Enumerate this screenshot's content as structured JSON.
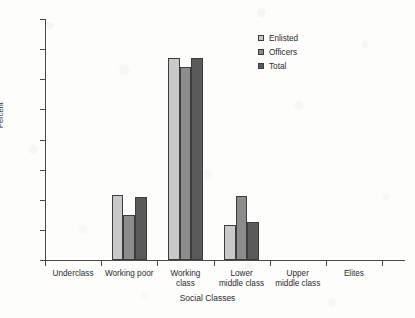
{
  "chart_data": {
    "type": "bar",
    "title": "",
    "xlabel": "Social Classes",
    "ylabel": "Percent",
    "categories": [
      "Underclass",
      "Working poor",
      "Working\nclass",
      "Lower\nmiddle class",
      "Upper\nmiddle class",
      "Elites"
    ],
    "series": [
      {
        "name": "Enlisted",
        "color": "#c9c9c9",
        "values": [
          0,
          21.5,
          67,
          11.5,
          0,
          0
        ]
      },
      {
        "name": "Officers",
        "color": "#8c8c8c",
        "values": [
          0,
          15,
          64,
          21.3,
          0,
          0
        ]
      },
      {
        "name": "Total",
        "color": "#5a5a5a",
        "values": [
          0,
          21,
          67,
          12.5,
          0,
          0
        ]
      }
    ],
    "ylim": [
      0,
      80
    ],
    "yticks": [
      0,
      10,
      20,
      30,
      40,
      50,
      60,
      70,
      80
    ],
    "ytick_labels": [
      "0",
      "10",
      "20",
      "30",
      "40",
      "50",
      "60",
      "70",
      "80"
    ],
    "grid": false,
    "legend_position": "top-right"
  },
  "legend": {
    "entries": [
      {
        "label": "Enlisted"
      },
      {
        "label": "Officers"
      },
      {
        "label": "Total"
      }
    ]
  }
}
